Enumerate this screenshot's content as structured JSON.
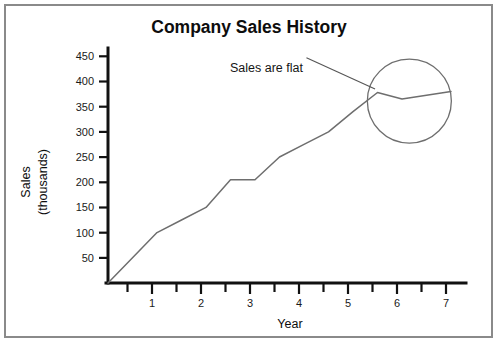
{
  "chart_data": {
    "type": "line",
    "title": "Company Sales History",
    "xlabel": "Year",
    "ylabel": "Sales\n(thousands)",
    "ylabel_lines": [
      "Sales",
      "(thousands)"
    ],
    "xlim": [
      0,
      7.6
    ],
    "ylim": [
      0,
      475
    ],
    "grid": false,
    "legend": null,
    "x_ticks": [
      1,
      2,
      3,
      4,
      5,
      6,
      7
    ],
    "x_tick_labels": [
      "1",
      "2",
      "3",
      "4",
      "5",
      "6",
      "7"
    ],
    "x_minor_ticks": [
      0.5,
      1.5,
      2.5,
      3.5,
      4.5,
      5.5,
      6.5,
      7.5
    ],
    "y_ticks": [
      50,
      100,
      150,
      200,
      250,
      300,
      350,
      400,
      450
    ],
    "y_tick_labels": [
      "50",
      "100",
      "150",
      "200",
      "250",
      "300",
      "350",
      "400",
      "450"
    ],
    "series": [
      {
        "name": "Sales",
        "color": "#6e6e6e",
        "x": [
          0,
          1,
          1.5,
          2,
          2.5,
          3,
          3.5,
          4,
          4.5,
          5,
          5.5,
          6,
          7
        ],
        "values": [
          0,
          100,
          125,
          150,
          205,
          205,
          250,
          275,
          300,
          340,
          378,
          365,
          380
        ]
      }
    ],
    "annotations": [
      {
        "text": "Sales are flat",
        "x": 4.05,
        "y": 447,
        "points_to": {
          "x": 5.45,
          "y": 385
        }
      }
    ],
    "highlight_circle": {
      "center_x": 6.15,
      "center_y": 361,
      "radius_px": 42
    }
  },
  "colors": {
    "frame_border": "#8a8a8a",
    "axis": "#111111",
    "data_line": "#6e6e6e",
    "annotation_line": "#555555",
    "text": "#0d0d0d",
    "background": "#ffffff"
  }
}
